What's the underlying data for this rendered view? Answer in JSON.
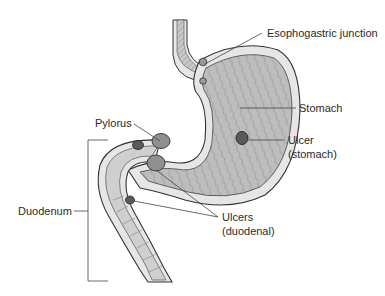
{
  "diagram": {
    "type": "anatomical illustration",
    "colors": {
      "outline": "#333333",
      "wall": "#e6e6e6",
      "lumen": "#b9b9b9",
      "ulcer": "#5a5a5a",
      "pylorus_lump": "#8f8f8f",
      "leader": "#444444",
      "text": "#2a2a2a"
    },
    "labels": {
      "esophogastric_junction": "Esophogastric junction",
      "stomach": "Stomach",
      "ulcer_stomach_line1": "Ulcer",
      "ulcer_stomach_line2": "(stomach)",
      "pylorus": "Pylorus",
      "ulcers_duodenal_line1": "Ulcers",
      "ulcers_duodenal_line2": "(duodenal)",
      "duodenum": "Duodenum"
    }
  }
}
